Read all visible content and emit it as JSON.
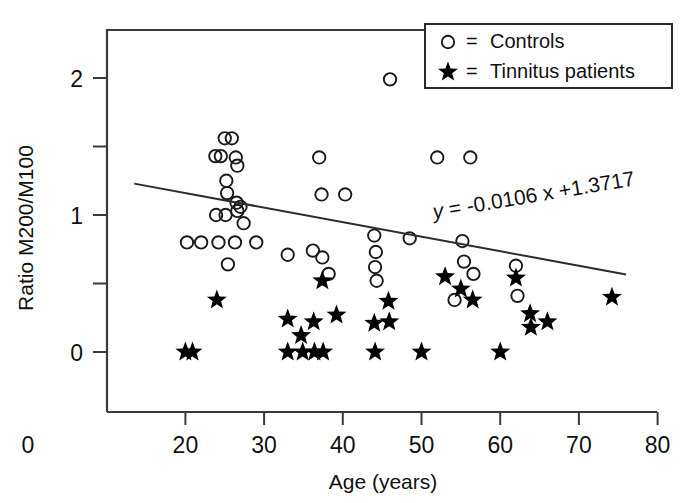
{
  "chart_data": {
    "type": "scatter",
    "title": "",
    "xlabel": "Age (years)",
    "ylabel": "Ratio M200/M100",
    "xlim": [
      0,
      80
    ],
    "ylim": [
      -0.25,
      2.35
    ],
    "xticks": [
      0,
      20,
      30,
      40,
      50,
      60,
      70,
      80
    ],
    "xtick_labels": [
      "0",
      "20",
      "30",
      "40",
      "50",
      "60",
      "70",
      "80"
    ],
    "yticks": [
      0,
      1,
      2
    ],
    "ytick_labels": [
      "0",
      "1",
      "2"
    ],
    "yticks_minor": [
      0.5,
      1.5
    ],
    "grid": false,
    "legend_position": "top-right",
    "legend": [
      {
        "marker": "open-circle",
        "symbol": "○",
        "equals": "=",
        "label": "Controls"
      },
      {
        "marker": "filled-star",
        "symbol": "★",
        "equals": "=",
        "label": "Tinnitus patients"
      }
    ],
    "annotations": [
      {
        "name": "regression-equation",
        "text": "y = -0.0106 x +1.3717",
        "italic_var": "y",
        "slope": -0.0106,
        "intercept": 1.3717,
        "x": 52,
        "y": 1.02
      }
    ],
    "regression_line": {
      "slope": -0.0106,
      "intercept": 1.3717,
      "x_start": 13.5,
      "x_end": 76.0,
      "y_start": 1.229,
      "y_end": 0.566
    },
    "series": [
      {
        "name": "Controls",
        "marker": "open-circle",
        "color": "#1a1a1a",
        "points": [
          [
            20.2,
            0.8
          ],
          [
            22.0,
            0.8
          ],
          [
            23.8,
            1.43
          ],
          [
            23.9,
            1.0
          ],
          [
            24.5,
            1.43
          ],
          [
            24.2,
            0.8
          ],
          [
            25.0,
            1.56
          ],
          [
            25.9,
            1.56
          ],
          [
            25.2,
            1.25
          ],
          [
            25.3,
            1.16
          ],
          [
            25.1,
            1.0
          ],
          [
            25.4,
            0.64
          ],
          [
            26.4,
            1.42
          ],
          [
            26.6,
            1.36
          ],
          [
            26.5,
            1.09
          ],
          [
            26.6,
            1.03
          ],
          [
            26.3,
            0.8
          ],
          [
            27.0,
            1.06
          ],
          [
            27.4,
            0.94
          ],
          [
            29.0,
            0.8
          ],
          [
            33.0,
            0.71
          ],
          [
            36.2,
            0.74
          ],
          [
            37.0,
            1.42
          ],
          [
            37.3,
            1.15
          ],
          [
            37.4,
            0.69
          ],
          [
            38.2,
            0.57
          ],
          [
            40.3,
            1.15
          ],
          [
            44.0,
            0.85
          ],
          [
            44.2,
            0.73
          ],
          [
            44.1,
            0.62
          ],
          [
            44.3,
            0.52
          ],
          [
            46.0,
            1.99
          ],
          [
            48.5,
            0.83
          ],
          [
            52.0,
            1.42
          ],
          [
            54.2,
            0.38
          ],
          [
            55.2,
            0.81
          ],
          [
            55.4,
            0.66
          ],
          [
            56.2,
            1.42
          ],
          [
            56.6,
            0.57
          ],
          [
            62.0,
            0.63
          ],
          [
            62.2,
            0.41
          ]
        ]
      },
      {
        "name": "Tinnitus patients",
        "marker": "filled-star",
        "color": "#000000",
        "points": [
          [
            20.0,
            0.0
          ],
          [
            20.9,
            0.0
          ],
          [
            24.0,
            0.38
          ],
          [
            33.0,
            0.24
          ],
          [
            33.0,
            0.0
          ],
          [
            34.7,
            0.12
          ],
          [
            34.9,
            0.0
          ],
          [
            36.3,
            0.22
          ],
          [
            36.4,
            0.0
          ],
          [
            37.4,
            0.52
          ],
          [
            37.5,
            0.0
          ],
          [
            39.2,
            0.27
          ],
          [
            44.0,
            0.21
          ],
          [
            44.1,
            0.0
          ],
          [
            45.8,
            0.37
          ],
          [
            45.9,
            0.22
          ],
          [
            50.0,
            0.0
          ],
          [
            53.0,
            0.55
          ],
          [
            55.0,
            0.46
          ],
          [
            56.5,
            0.38
          ],
          [
            60.0,
            0.0
          ],
          [
            62.0,
            0.54
          ],
          [
            63.8,
            0.28
          ],
          [
            63.9,
            0.18
          ],
          [
            66.0,
            0.22
          ],
          [
            74.2,
            0.4
          ]
        ]
      }
    ]
  }
}
